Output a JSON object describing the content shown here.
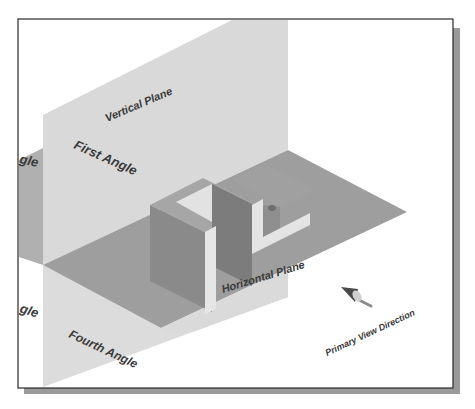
{
  "diagram": {
    "labels": {
      "vertical_plane": "Vertical Plane",
      "horizontal_plane": "Horizontal Plane",
      "first_angle": "First Angle",
      "fourth_angle": "Fourth Angle",
      "second_angle_fragment": "gle",
      "third_angle_fragment": "gle",
      "primary_view_direction": "Primary View Direction"
    },
    "colors": {
      "background": "#ffffff",
      "frame_border": "#2a2a2a",
      "frame_shadow": "#9a9a9a",
      "vertical_plane": "#d8d8d8",
      "vertical_plane_far": "#a9a9a9",
      "horizontal_plane": "#9c9c9c",
      "cube_front": "#8a8a8a",
      "cube_side": "#777777",
      "cube_top": "#a8a8a8",
      "cube_cut_light": "#e4e4e4",
      "label_text": "#3a3a3a",
      "arrow": "#555555"
    },
    "objects": {
      "block": "L-notched block resting on horizontal plane",
      "arrow": "viewing direction arrow"
    }
  }
}
